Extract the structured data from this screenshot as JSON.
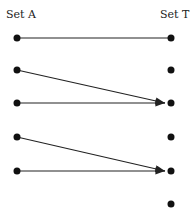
{
  "labels": {
    "left": "Set A",
    "right": "Set T"
  },
  "left_nodes": [
    38,
    70,
    103,
    137,
    171
  ],
  "right_nodes": [
    38,
    70,
    103,
    137,
    171,
    204
  ],
  "edges": [
    {
      "from": 0,
      "to": 0,
      "arrow": false
    },
    {
      "from": 1,
      "to": 2,
      "arrow": true
    },
    {
      "from": 2,
      "to": 2,
      "arrow": true
    },
    {
      "from": 3,
      "to": 4,
      "arrow": true
    },
    {
      "from": 4,
      "to": 4,
      "arrow": true
    }
  ]
}
